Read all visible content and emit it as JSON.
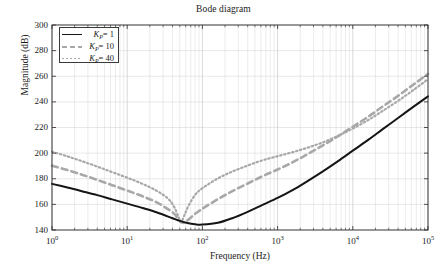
{
  "chart_data": {
    "type": "line",
    "title": "Bode diagram",
    "xlabel": "Frequency (Hz)",
    "ylabel": "Magnitude (dB)",
    "xscale": "log",
    "yscale": "linear",
    "xlim": [
      1,
      100000
    ],
    "ylim": [
      140,
      300
    ],
    "grid": true,
    "grid_minor": true,
    "legend_position": "upper left",
    "xticks": [
      1,
      10,
      100,
      1000,
      10000,
      100000
    ],
    "xticklabels": [
      "10^0",
      "10^1",
      "10^2",
      "10^3",
      "10^4",
      "10^5"
    ],
    "yticks": [
      140,
      160,
      180,
      200,
      220,
      240,
      260,
      280,
      300
    ],
    "yticklabels": [
      "140",
      "160",
      "180",
      "200",
      "220",
      "240",
      "260",
      "280",
      "300"
    ],
    "series": [
      {
        "name": "K_P = 1",
        "label_base": "K",
        "label_sub": "P",
        "label_value": "1",
        "style": "solid",
        "color": "#151515",
        "width": 2.0,
        "x": [
          1,
          1.6,
          2.5,
          4,
          6.3,
          10,
          16,
          25,
          40,
          50,
          63,
          80,
          100,
          160,
          250,
          400,
          630,
          1000,
          1600,
          2500,
          4000,
          6300,
          10000,
          16000,
          25000,
          40000,
          63000,
          100000
        ],
        "y": [
          176.0,
          173.2,
          170.3,
          167.2,
          163.9,
          160.6,
          157.2,
          153.7,
          149.2,
          147.1,
          145.4,
          144.4,
          144.2,
          145.6,
          149.2,
          154.2,
          159.6,
          165.0,
          171.3,
          178.2,
          185.8,
          193.6,
          201.9,
          210.3,
          218.7,
          227.4,
          235.9,
          244.3
        ]
      },
      {
        "name": "K_P = 10",
        "label_base": "K",
        "label_sub": "P",
        "label_value": "10",
        "style": "dashed",
        "color": "#a8a8a8",
        "width": 2.6,
        "x": [
          1,
          1.6,
          2.5,
          4,
          6.3,
          10,
          16,
          25,
          40,
          48,
          55,
          63,
          80,
          100,
          160,
          250,
          400,
          630,
          1000,
          1600,
          2500,
          4000,
          6300,
          10000,
          16000,
          25000,
          40000,
          63000,
          100000
        ],
        "y": [
          190.2,
          186.8,
          183.2,
          179.1,
          175.0,
          170.8,
          166.3,
          161.4,
          153.9,
          148.6,
          145.6,
          147.4,
          152.6,
          156.6,
          164.0,
          170.3,
          176.3,
          182.0,
          187.2,
          193.0,
          199.2,
          206.0,
          213.0,
          220.6,
          228.4,
          236.4,
          244.7,
          253.2,
          261.8
        ]
      },
      {
        "name": "K_P = 40",
        "label_base": "K",
        "label_sub": "P",
        "label_value": "40",
        "style": "dotted",
        "color": "#a8a8a8",
        "width": 2.2,
        "x": [
          1,
          1.6,
          2.5,
          4,
          6.3,
          10,
          16,
          25,
          35,
          42,
          48,
          52,
          58,
          66,
          80,
          100,
          160,
          250,
          400,
          630,
          1000,
          1600,
          2500,
          4000,
          6300,
          10000,
          16000,
          25000,
          40000,
          63000,
          100000
        ],
        "y": [
          201.2,
          197.5,
          193.7,
          189.5,
          185.2,
          180.8,
          176.0,
          170.4,
          164.4,
          158.2,
          150.4,
          146.0,
          152.0,
          159.4,
          167.4,
          172.6,
          180.2,
          185.6,
          190.3,
          194.4,
          197.6,
          200.8,
          204.2,
          208.4,
          213.4,
          219.2,
          225.8,
          233.0,
          240.8,
          249.0,
          257.6
        ]
      }
    ],
    "notes": {
      "convergence_freq_hz": 4000,
      "minimum_magnitude_db": 144.2,
      "endpoint_magnitude_db": 284.0
    }
  },
  "legend": {
    "entries": [
      {
        "base": "K",
        "sub": "P",
        "eq": "= 1"
      },
      {
        "base": "K",
        "sub": "P",
        "eq": "= 10"
      },
      {
        "base": "K",
        "sub": "P",
        "eq": "= 40"
      }
    ]
  }
}
